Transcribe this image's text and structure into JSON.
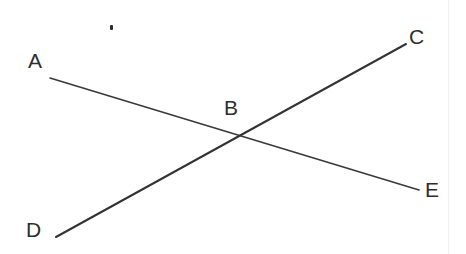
{
  "figure": {
    "type": "geometry-diagram",
    "width": 466,
    "height": 254,
    "background_color": "#ffffff",
    "stroke_color": "#333333",
    "label_color": "#2e2e2e"
  },
  "points": [
    {
      "id": "A",
      "label": "A",
      "x": 36,
      "y": 62,
      "role": "segment-endpoint"
    },
    {
      "id": "B",
      "label": "B",
      "x": 238,
      "y": 138,
      "role": "intersection-point"
    },
    {
      "id": "C",
      "label": "C",
      "x": 418,
      "y": 37,
      "role": "segment-endpoint"
    },
    {
      "id": "D",
      "label": "D",
      "x": 34,
      "y": 230,
      "role": "segment-endpoint"
    },
    {
      "id": "E",
      "label": "E",
      "x": 433,
      "y": 190,
      "role": "segment-endpoint"
    }
  ],
  "segments": [
    {
      "id": "AE",
      "name": "segment-a-e",
      "from": "A",
      "to": "E",
      "x1": 50,
      "y1": 78,
      "x2": 419,
      "y2": 190,
      "stroke_width": 1.6,
      "color": "#3a3a3a"
    },
    {
      "id": "DC",
      "name": "segment-d-c",
      "from": "D",
      "to": "C",
      "x1": 56,
      "y1": 237,
      "x2": 406,
      "y2": 44,
      "stroke_width": 2.0,
      "color": "#333333"
    }
  ],
  "intersection": {
    "label": "B",
    "x": 238,
    "y": 138,
    "label_x": 232,
    "label_y": 108
  },
  "artifacts": [
    {
      "id": "speck",
      "name": "scan-speck",
      "x": 112,
      "y": 27,
      "color": "#2b2b2b"
    }
  ],
  "labels": {
    "A": "A",
    "B": "B",
    "C": "C",
    "D": "D",
    "E": "E"
  }
}
